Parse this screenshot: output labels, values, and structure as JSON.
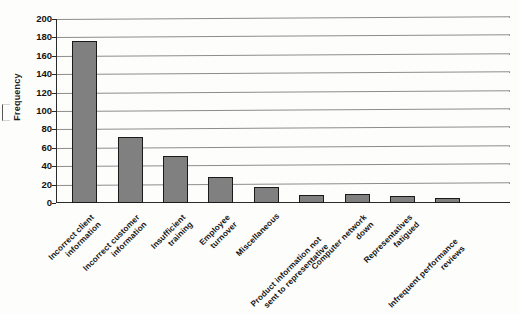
{
  "chart_data": {
    "type": "bar",
    "title": "",
    "xlabel": "",
    "ylabel": "Frequency",
    "ylim": [
      0,
      200
    ],
    "ytick_step": 20,
    "yticks": [
      200,
      180,
      160,
      140,
      120,
      100,
      80,
      60,
      40,
      20,
      0
    ],
    "grid": true,
    "legend": "none",
    "bar_color": "#808080",
    "bar_border_color": "#1a1a1a",
    "categories": [
      "Incorrect client\ninformation",
      "Incorrect customer\ninformation",
      "Insufficient\ntraining",
      "Employee\nturnover",
      "Miscellaneous",
      "Product information not\nsent to representative",
      "Computer network\ndown",
      "Representatives\nfatigued",
      "Infrequent performance\nreviews"
    ],
    "values": [
      176,
      72,
      51,
      28,
      17,
      9,
      10,
      8,
      5
    ]
  },
  "axis": {
    "y_title": "Frequency"
  }
}
